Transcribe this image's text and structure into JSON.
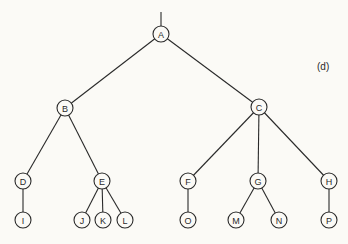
{
  "diagram": {
    "type": "tree",
    "panel_label": "(d)",
    "root": "A",
    "nodes": [
      {
        "id": "A",
        "label": "A",
        "x": 161,
        "y": 34
      },
      {
        "id": "B",
        "label": "B",
        "x": 65,
        "y": 108
      },
      {
        "id": "C",
        "label": "C",
        "x": 259,
        "y": 107
      },
      {
        "id": "D",
        "label": "D",
        "x": 23,
        "y": 181
      },
      {
        "id": "E",
        "label": "E",
        "x": 102,
        "y": 181
      },
      {
        "id": "F",
        "label": "F",
        "x": 188,
        "y": 181
      },
      {
        "id": "G",
        "label": "G",
        "x": 258,
        "y": 181
      },
      {
        "id": "H",
        "label": "H",
        "x": 329,
        "y": 181
      },
      {
        "id": "I",
        "label": "I",
        "x": 23,
        "y": 220
      },
      {
        "id": "J",
        "label": "J",
        "x": 82,
        "y": 220
      },
      {
        "id": "K",
        "label": "K",
        "x": 103,
        "y": 220
      },
      {
        "id": "L",
        "label": "L",
        "x": 125,
        "y": 220
      },
      {
        "id": "O",
        "label": "O",
        "x": 188,
        "y": 220
      },
      {
        "id": "M",
        "label": "M",
        "x": 236,
        "y": 220
      },
      {
        "id": "N",
        "label": "N",
        "x": 279,
        "y": 220
      },
      {
        "id": "P",
        "label": "P",
        "x": 329,
        "y": 220
      }
    ],
    "edges": [
      [
        "A",
        "B"
      ],
      [
        "A",
        "C"
      ],
      [
        "B",
        "D"
      ],
      [
        "B",
        "E"
      ],
      [
        "C",
        "F"
      ],
      [
        "C",
        "G"
      ],
      [
        "C",
        "H"
      ],
      [
        "D",
        "I"
      ],
      [
        "E",
        "J"
      ],
      [
        "E",
        "K"
      ],
      [
        "E",
        "L"
      ],
      [
        "F",
        "O"
      ],
      [
        "G",
        "M"
      ],
      [
        "G",
        "N"
      ],
      [
        "H",
        "P"
      ]
    ],
    "root_stub": {
      "x": 161,
      "y1": 12,
      "y2": 26
    }
  }
}
